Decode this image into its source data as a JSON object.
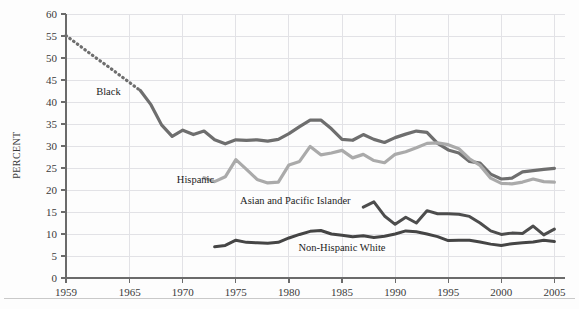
{
  "chart_data": {
    "type": "line",
    "title": "",
    "subtitle": "",
    "xlabel": "",
    "ylabel": "PERCENT",
    "xlim": [
      1959,
      2006
    ],
    "ylim": [
      0,
      60
    ],
    "grid": true,
    "legend_position": "inline-annotations",
    "x_ticks": [
      "1959",
      "1965",
      "1970",
      "1975",
      "1980",
      "1985",
      "1990",
      "1995",
      "2000",
      "2005"
    ],
    "x_tick_values": [
      1959,
      1965,
      1970,
      1975,
      1980,
      1985,
      1990,
      1995,
      2000,
      2005
    ],
    "y_ticks": [
      "0",
      "5",
      "10",
      "15",
      "20",
      "25",
      "30",
      "35",
      "40",
      "45",
      "50",
      "55",
      "60"
    ],
    "y_tick_values": [
      0,
      5,
      10,
      15,
      20,
      25,
      30,
      35,
      40,
      45,
      50,
      55,
      60
    ],
    "series": [
      {
        "name": "Black",
        "color": "#6e6e6e",
        "width": 3.2,
        "label": "Black",
        "label_x": 1963.0,
        "label_y": 41.5,
        "dashed_until": 1966,
        "x": [
          1959,
          1960,
          1961,
          1962,
          1963,
          1964,
          1965,
          1966,
          1967,
          1968,
          1969,
          1970,
          1971,
          1972,
          1973,
          1974,
          1975,
          1976,
          1977,
          1978,
          1979,
          1980,
          1981,
          1982,
          1983,
          1984,
          1985,
          1986,
          1987,
          1988,
          1989,
          1990,
          1991,
          1992,
          1993,
          1994,
          1995,
          1996,
          1997,
          1998,
          1999,
          2000,
          2001,
          2002,
          2003,
          2004,
          2005
        ],
        "values": [
          55.1,
          53.3,
          51.5,
          49.7,
          48.0,
          46.2,
          44.4,
          42.6,
          39.4,
          34.8,
          32.2,
          33.6,
          32.6,
          33.4,
          31.4,
          30.5,
          31.4,
          31.3,
          31.4,
          31.1,
          31.5,
          32.8,
          34.4,
          35.9,
          35.9,
          33.9,
          31.5,
          31.3,
          32.6,
          31.5,
          30.8,
          31.9,
          32.7,
          33.4,
          33.1,
          30.6,
          29.1,
          28.4,
          26.5,
          26.1,
          23.6,
          22.5,
          22.7,
          24.1,
          24.4,
          24.7,
          24.9
        ]
      },
      {
        "name": "Hispanic",
        "color": "#aaaaaa",
        "width": 3.2,
        "label": "Hispanic",
        "label_x": 1971.2,
        "label_y": 21.6,
        "dashed_until": null,
        "x": [
          1972,
          1973,
          1974,
          1975,
          1976,
          1977,
          1978,
          1979,
          1980,
          1981,
          1982,
          1983,
          1984,
          1985,
          1986,
          1987,
          1988,
          1989,
          1990,
          1991,
          1992,
          1993,
          1994,
          1995,
          1996,
          1997,
          1998,
          1999,
          2000,
          2001,
          2002,
          2003,
          2004,
          2005
        ],
        "values": [
          22.8,
          21.9,
          23.0,
          26.9,
          24.7,
          22.4,
          21.6,
          21.8,
          25.7,
          26.5,
          29.9,
          28.0,
          28.4,
          29.0,
          27.3,
          28.1,
          26.7,
          26.2,
          28.1,
          28.7,
          29.6,
          30.6,
          30.7,
          30.3,
          29.4,
          27.1,
          25.6,
          22.7,
          21.5,
          21.4,
          21.8,
          22.5,
          21.9,
          21.8
        ]
      },
      {
        "name": "Asian and Pacific Islander",
        "color": "#4d4d4d",
        "width": 3.0,
        "label": "Asian and Pacific Islander",
        "label_x": 1980.6,
        "label_y": 16.9,
        "dashed_until": null,
        "x": [
          1987,
          1988,
          1989,
          1990,
          1991,
          1992,
          1993,
          1994,
          1995,
          1996,
          1997,
          1998,
          1999,
          2000,
          2001,
          2002,
          2003,
          2004,
          2005
        ],
        "values": [
          16.1,
          17.3,
          14.1,
          12.2,
          13.8,
          12.5,
          15.3,
          14.6,
          14.6,
          14.5,
          14.0,
          12.5,
          10.7,
          9.9,
          10.2,
          10.1,
          11.8,
          9.8,
          11.1
        ]
      },
      {
        "name": "Non-Hispanic White",
        "color": "#454545",
        "width": 3.0,
        "label": "Non-Hispanic White",
        "label_x": 1985.0,
        "label_y": 6.2,
        "dashed_until": null,
        "x": [
          1973,
          1974,
          1975,
          1976,
          1977,
          1978,
          1979,
          1980,
          1981,
          1982,
          1983,
          1984,
          1985,
          1986,
          1987,
          1988,
          1989,
          1990,
          1991,
          1992,
          1993,
          1994,
          1995,
          1996,
          1997,
          1998,
          1999,
          2000,
          2001,
          2002,
          2003,
          2004,
          2005
        ],
        "values": [
          7.1,
          7.4,
          8.6,
          8.1,
          8.0,
          7.9,
          8.1,
          9.1,
          9.9,
          10.6,
          10.8,
          10.0,
          9.7,
          9.4,
          9.6,
          9.2,
          9.5,
          10.0,
          10.7,
          10.5,
          10.0,
          9.4,
          8.5,
          8.6,
          8.6,
          8.2,
          7.7,
          7.4,
          7.8,
          8.0,
          8.2,
          8.6,
          8.3
        ]
      }
    ]
  }
}
